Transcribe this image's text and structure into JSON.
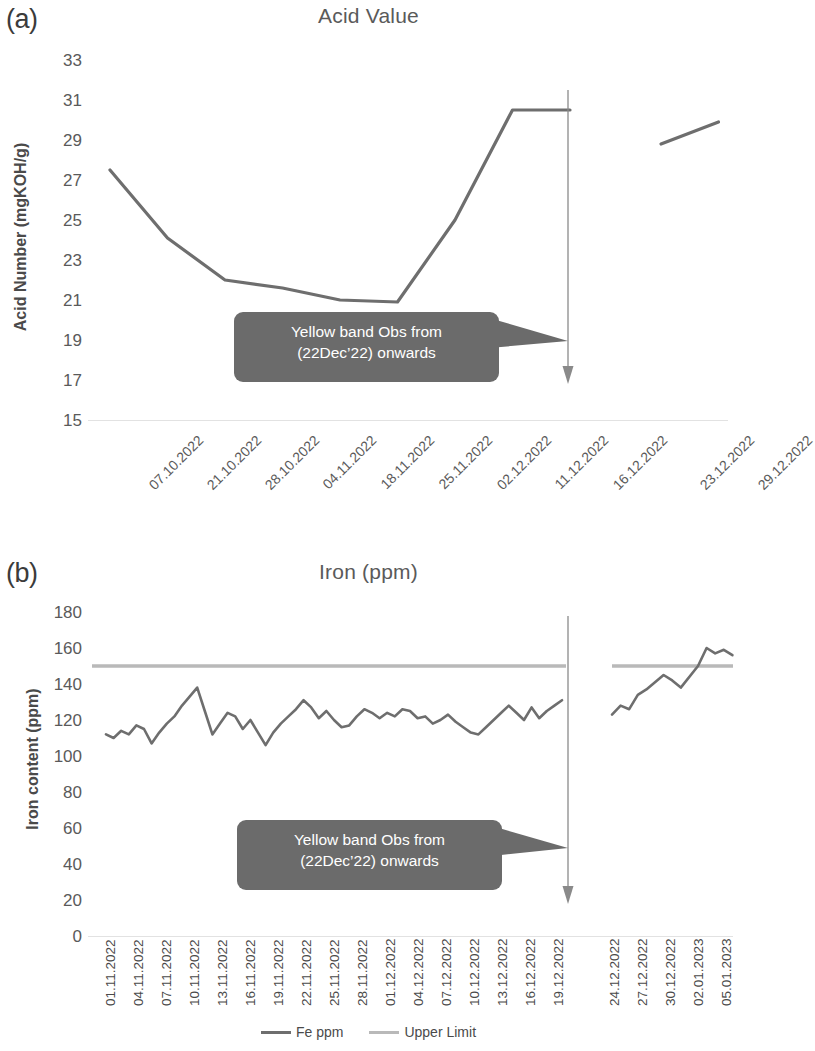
{
  "figure": {
    "panels": [
      {
        "letter": "(a)",
        "title": "Acid Value",
        "ylabel": "Acid Number (mgKOH/g)",
        "annotation_line1": "Yellow band Obs from",
        "annotation_line2": "(22Dec’22) onwards"
      },
      {
        "letter": "(b)",
        "title": "Iron (ppm)",
        "ylabel": "Iron content (ppm)",
        "annotation_line1": "Yellow band Obs from",
        "annotation_line2": "(22Dec’22) onwards"
      }
    ],
    "legend": [
      {
        "label": "Fe ppm",
        "color": "#6e6e6e"
      },
      {
        "label": "Upper Limit",
        "color": "#b9b9b9"
      }
    ],
    "colors": {
      "series": "#6e6e6e",
      "limit": "#b9b9b9",
      "callout_bg": "#6b6b6b",
      "callout_text": "#ffffff",
      "axis_text": "#5a5a5a",
      "baseline": "#e2e2e2"
    }
  },
  "chart_data": [
    {
      "type": "line",
      "title": "Acid Value",
      "panel": "(a)",
      "xlabel": "",
      "ylabel": "Acid Number (mgKOH/g)",
      "ylim": [
        15,
        33
      ],
      "yticks": [
        15,
        17,
        19,
        21,
        23,
        25,
        27,
        29,
        31,
        33
      ],
      "grid": false,
      "legend_position": "none",
      "categories": [
        "07.10.2022",
        "21.10.2022",
        "28.10.2022",
        "04.11.2022",
        "18.11.2022",
        "25.11.2022",
        "02.12.2022",
        "11.12.2022",
        "16.12.2022",
        "",
        "23.12.2022",
        "29.12.2022"
      ],
      "series": [
        {
          "name": "Acid Number",
          "values": [
            27.5,
            24.1,
            22.0,
            21.6,
            21.0,
            20.9,
            25.0,
            30.5,
            30.5,
            null,
            28.8,
            29.9
          ]
        }
      ],
      "annotations": [
        {
          "text": "Yellow band Obs from (22Dec’22) onwards",
          "type": "callout",
          "points_to": "vertical-divider-after-16.12.2022"
        },
        {
          "text": "",
          "type": "vertical-arrow",
          "x_position_between": [
            "16.12.2022",
            "23.12.2022"
          ]
        }
      ]
    },
    {
      "type": "line",
      "title": "Iron (ppm)",
      "panel": "(b)",
      "xlabel": "",
      "ylabel": "Iron content (ppm)",
      "ylim": [
        0,
        180
      ],
      "yticks": [
        0,
        20,
        40,
        60,
        80,
        100,
        120,
        140,
        160,
        180
      ],
      "grid": false,
      "legend_position": "bottom",
      "upper_limit": 150,
      "categories": [
        "01.11.2022",
        "04.11.2022",
        "07.11.2022",
        "10.11.2022",
        "13.11.2022",
        "16.11.2022",
        "19.11.2022",
        "22.11.2022",
        "25.11.2022",
        "28.11.2022",
        "01.12.2022",
        "04.12.2022",
        "07.12.2022",
        "10.12.2022",
        "13.12.2022",
        "16.12.2022",
        "19.12.2022",
        "",
        "24.12.2022",
        "27.12.2022",
        "30.12.2022",
        "02.01.2023",
        "05.01.2023"
      ],
      "series": [
        {
          "name": "Fe ppm",
          "values": [
            112,
            110,
            114,
            112,
            117,
            115,
            107,
            113,
            118,
            122,
            128,
            133,
            138,
            125,
            112,
            118,
            124,
            122,
            115,
            120,
            113,
            106,
            113,
            118,
            122,
            126,
            131,
            127,
            121,
            125,
            120,
            116,
            117,
            122,
            126,
            124,
            121,
            124,
            122,
            126,
            125,
            121,
            122,
            118,
            120,
            123,
            119,
            116,
            113,
            112,
            116,
            120,
            124,
            128,
            124,
            120,
            127,
            121,
            125,
            128,
            131
          ]
        },
        {
          "name": "Fe ppm (after gap)",
          "values": [
            123,
            128,
            126,
            134,
            137,
            141,
            145,
            142,
            138,
            null,
            150,
            160,
            157,
            159,
            156
          ]
        },
        {
          "name": "Upper Limit",
          "values": [
            150,
            150
          ]
        }
      ],
      "annotations": [
        {
          "text": "Yellow band Obs from (22Dec’22) onwards",
          "type": "callout",
          "points_to": "vertical-divider-after-19.12.2022"
        },
        {
          "text": "",
          "type": "vertical-arrow",
          "x_position_between": [
            "19.12.2022",
            "24.12.2022"
          ]
        }
      ]
    }
  ]
}
